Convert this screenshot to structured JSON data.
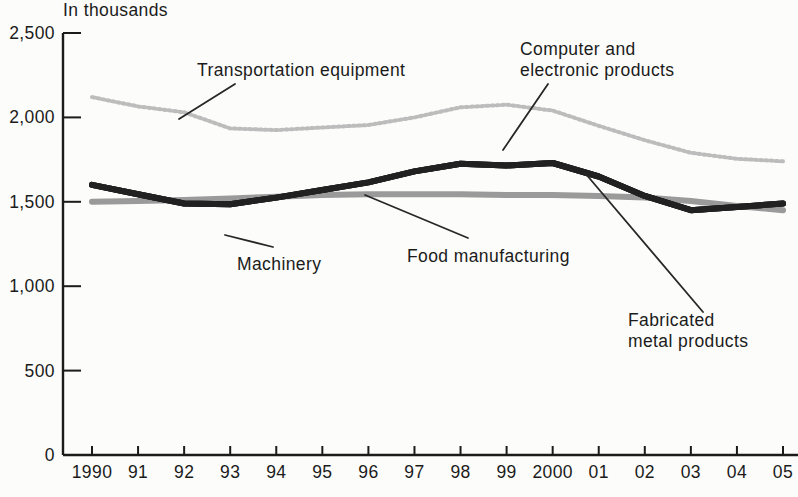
{
  "chart_data": {
    "type": "line",
    "units_label": "In thousands",
    "x_labels": [
      "1990",
      "91",
      "92",
      "93",
      "94",
      "95",
      "96",
      "97",
      "98",
      "99",
      "2000",
      "01",
      "02",
      "03",
      "04",
      "05"
    ],
    "y_ticks": [
      {
        "value": 0,
        "label": "0"
      },
      {
        "value": 500,
        "label": "500"
      },
      {
        "value": 1000,
        "label": "1,000"
      },
      {
        "value": 1500,
        "label": "1,500"
      },
      {
        "value": 2000,
        "label": "2,000"
      },
      {
        "value": 2500,
        "label": "2,500"
      }
    ],
    "ylim": [
      0,
      2500
    ],
    "grid": false,
    "legend": "direct line labels with leader lines",
    "colors": {
      "background": "#fcfcfa",
      "text": "#1b1b1b",
      "dark_line": "#212121",
      "food_line": "#9a9a9a",
      "transportation_line": "#bcbcbc"
    },
    "series": [
      {
        "name": "Transportation equipment",
        "color": "#bcbcbc",
        "stroke_width": 4,
        "dashed": true,
        "values": [
          2120,
          2065,
          2030,
          1935,
          1925,
          1940,
          1955,
          2000,
          2060,
          2075,
          2040,
          1950,
          1865,
          1790,
          1755,
          1740
        ]
      },
      {
        "name": "Food manufacturing",
        "color": "#9a9a9a",
        "stroke_width": 6,
        "dashed": false,
        "values": [
          1500,
          1505,
          1510,
          1520,
          1530,
          1540,
          1545,
          1545,
          1545,
          1540,
          1540,
          1535,
          1525,
          1505,
          1475,
          1450
        ]
      },
      {
        "name": "Machinery",
        "color": "#212121",
        "stroke_width": 6,
        "dashed": false,
        "note": "In the scanned print the Machinery, Computer and electronic products, and Fabricated metal products curves coincide as one dark line; values read from that line.",
        "values": [
          1600,
          1545,
          1490,
          1485,
          1525,
          1570,
          1615,
          1680,
          1725,
          1715,
          1730,
          1650,
          1535,
          1450,
          1470,
          1490
        ]
      },
      {
        "name": "Computer and electronic products",
        "color": "#212121",
        "stroke_width": 6,
        "dashed": false,
        "note": "Coincides with the dark line shared with Fabricated metal products and Machinery in this scan.",
        "values": [
          1600,
          1545,
          1490,
          1485,
          1525,
          1570,
          1615,
          1680,
          1725,
          1715,
          1730,
          1650,
          1535,
          1450,
          1470,
          1490
        ]
      },
      {
        "name": "Fabricated metal products",
        "color": "#212121",
        "stroke_width": 6,
        "dashed": false,
        "note": "Coincides with the dark line shared with Computer and electronic products and Machinery in this scan.",
        "values": [
          1600,
          1545,
          1490,
          1485,
          1525,
          1570,
          1615,
          1680,
          1725,
          1715,
          1730,
          1650,
          1535,
          1450,
          1470,
          1490
        ]
      }
    ],
    "annotations": [
      {
        "name": "transportation-equipment",
        "text_lines": [
          "Transportation equipment"
        ],
        "text_x": 197,
        "text_y": 76,
        "line_height": 21,
        "leader": {
          "x1": 235,
          "y1": 84,
          "x2": 179,
          "y2": 119
        }
      },
      {
        "name": "computer-electronic-products",
        "text_lines": [
          "Computer and",
          "electronic products"
        ],
        "text_x": 520,
        "text_y": 55,
        "line_height": 21,
        "leader": {
          "x1": 548,
          "y1": 84,
          "x2": 503,
          "y2": 150
        }
      },
      {
        "name": "machinery",
        "text_lines": [
          "Machinery"
        ],
        "text_x": 237,
        "text_y": 270,
        "line_height": 21,
        "leader": {
          "x1": 273,
          "y1": 247,
          "x2": 225,
          "y2": 235
        }
      },
      {
        "name": "food-manufacturing",
        "text_lines": [
          "Food manufacturing"
        ],
        "text_x": 407,
        "text_y": 262,
        "line_height": 21,
        "leader": {
          "x1": 365,
          "y1": 195,
          "x2": 468,
          "y2": 238
        }
      },
      {
        "name": "fabricated-metal-products",
        "text_lines": [
          "Fabricated",
          "metal products"
        ],
        "text_x": 628,
        "text_y": 326,
        "line_height": 21,
        "leader": {
          "x1": 585,
          "y1": 173,
          "x2": 703,
          "y2": 312
        }
      }
    ]
  }
}
